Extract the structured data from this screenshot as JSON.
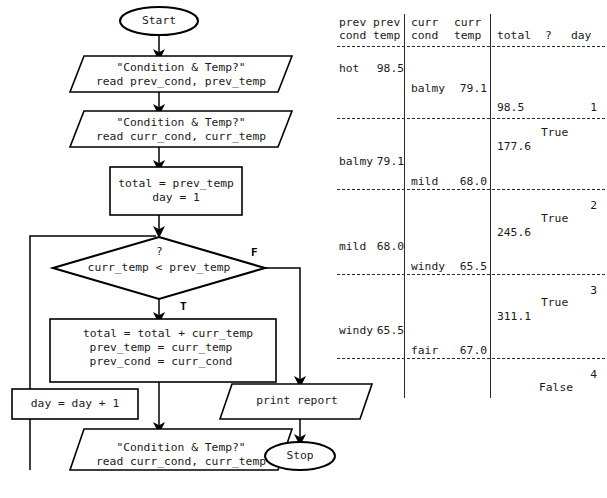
{
  "flowchart": {
    "start": {
      "label": "Start"
    },
    "stop": {
      "label": "Stop"
    },
    "io_prev": {
      "line1": "\"Condition & Temp?\"",
      "line2": "read prev_cond, prev_temp"
    },
    "io_curr_top": {
      "line1": "\"Condition & Temp?\"",
      "line2": "read curr_cond, curr_temp"
    },
    "init_box": {
      "line1": "total = prev_temp",
      "line2": "day = 1"
    },
    "decision": {
      "question_mark": "?",
      "condition": "curr_temp < prev_temp",
      "true_label": "T",
      "false_label": "F"
    },
    "accumulate_box": {
      "line1": "total = total + curr_temp",
      "line2": "prev_temp = curr_temp",
      "line3": "prev_cond = curr_cond"
    },
    "day_box": {
      "label": "day = day + 1"
    },
    "io_curr_bottom": {
      "line1": "\"Condition & Temp?\"",
      "line2": "read curr_cond, curr_temp"
    },
    "print_box": {
      "label": "print report"
    }
  },
  "trace_table": {
    "headers": {
      "prev_cond": {
        "line1": "prev",
        "line2": "cond"
      },
      "prev_temp": {
        "line1": "prev",
        "line2": "temp"
      },
      "curr_cond": {
        "line1": "curr",
        "line2": "cond"
      },
      "curr_temp": {
        "line1": "curr",
        "line2": "temp"
      },
      "total": "total",
      "question": "?",
      "day": "day"
    },
    "rows": [
      {
        "prev_cond": "hot",
        "prev_temp": "98.5",
        "curr_cond": "balmy",
        "curr_temp": "79.1",
        "total": "98.5",
        "question": "",
        "day": "1"
      },
      {
        "prev_cond": "balmy",
        "prev_temp": "79.1",
        "curr_cond": "mild",
        "curr_temp": "68.0",
        "total": "177.6",
        "question": "True",
        "day": "2"
      },
      {
        "prev_cond": "mild",
        "prev_temp": "68.0",
        "curr_cond": "windy",
        "curr_temp": "65.5",
        "total": "245.6",
        "question": "True",
        "day": "3"
      },
      {
        "prev_cond": "windy",
        "prev_temp": "65.5",
        "curr_cond": "fair",
        "curr_temp": "67.0",
        "total": "311.1",
        "question": "True",
        "day": "4"
      },
      {
        "prev_cond": "",
        "prev_temp": "",
        "curr_cond": "",
        "curr_temp": "",
        "total": "",
        "question": "False",
        "day": ""
      }
    ]
  }
}
